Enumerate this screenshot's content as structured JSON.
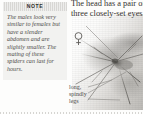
{
  "page": {
    "background_color": "#fdfdfc"
  },
  "note": {
    "header_label": "NOTE",
    "header_background": "#d8d7d4",
    "box_background": "#f2f2f0",
    "text": "The males look very similar to females but have a slender abdomen and are slightly smaller. The mating of these spiders can last for hours."
  },
  "body_copy": {
    "line1": "The head has a pair of",
    "line2": "three closely-set eyes."
  },
  "annotations": {
    "female_symbol": "♀",
    "female_symbol_name": "female-gender-symbol",
    "legs_label_line1": "long,",
    "legs_label_line2": "spindly",
    "legs_label_line3": "legs"
  },
  "photo": {
    "caption_alt": "grayscale photograph of a long-legged spider",
    "tone_light": "#ffffff",
    "tone_mid": "#cbc9c5",
    "tone_dark": "#8e8c88"
  },
  "rule": {
    "color": "#d6d5d2"
  }
}
